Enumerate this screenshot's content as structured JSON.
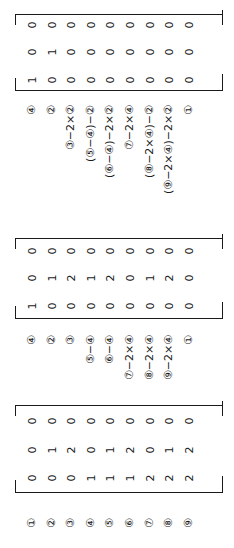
{
  "figure": {
    "orientation": "rotated 90deg counter-clockwise",
    "matrices": [
      {
        "id": "matrix-final",
        "rows": [
          [
            "0",
            "0",
            "0",
            "0",
            "0",
            "0",
            "0",
            "0",
            "0"
          ],
          [
            "0",
            "1",
            "0",
            "0",
            "0",
            "0",
            "0",
            "0",
            "0"
          ],
          [
            "1",
            "0",
            "0",
            "0",
            "0",
            "0",
            "0",
            "0",
            "0"
          ]
        ],
        "row_labels": [
          "④",
          "②",
          "③−2×②",
          "(⑤−④)−②",
          "(⑥−④)−2×②",
          "⑦−2×④",
          "(⑧−2×④)−②",
          "(⑨−2×④)−2×②",
          "①"
        ]
      },
      {
        "id": "matrix-intermediate",
        "rows": [
          [
            "0",
            "0",
            "0",
            "0",
            "0",
            "0",
            "0",
            "0",
            "0"
          ],
          [
            "0",
            "1",
            "2",
            "1",
            "2",
            "0",
            "1",
            "2",
            "0"
          ],
          [
            "1",
            "0",
            "0",
            "0",
            "0",
            "0",
            "0",
            "0",
            "0"
          ]
        ],
        "row_labels": [
          "④",
          "②",
          "③",
          "⑤−④",
          "⑥−④",
          "⑦−2×④",
          "⑧−2×④",
          "⑨−2×④",
          "①"
        ]
      },
      {
        "id": "matrix-initial",
        "rows": [
          [
            "0",
            "0",
            "0",
            "0",
            "0",
            "0",
            "0",
            "0",
            "0"
          ],
          [
            "0",
            "1",
            "2",
            "0",
            "1",
            "2",
            "0",
            "1",
            "2"
          ],
          [
            "0",
            "0",
            "0",
            "1",
            "1",
            "1",
            "2",
            "2",
            "2"
          ]
        ],
        "row_labels": [
          "①",
          "②",
          "③",
          "④",
          "⑤",
          "⑥",
          "⑦",
          "⑧",
          "⑨"
        ]
      }
    ]
  }
}
